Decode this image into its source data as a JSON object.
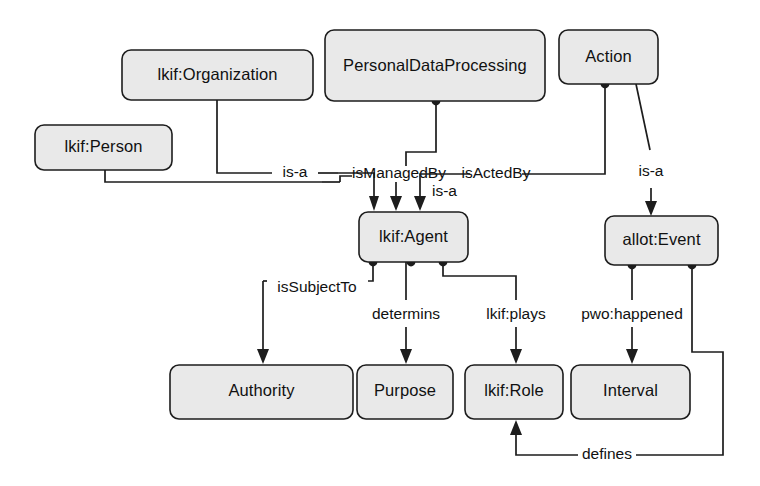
{
  "diagram": {
    "colors": {
      "node_fill": "#e9e9e9",
      "node_stroke": "#1d1d1d",
      "edge_stroke": "#1d1d1d",
      "background": "#ffffff",
      "text": "#111111"
    },
    "nodes": [
      {
        "id": "lkif-organization",
        "label": "lkif:Organization"
      },
      {
        "id": "lkif-person",
        "label": "lkif:Person"
      },
      {
        "id": "personaldataprocessing",
        "label": "PersonalDataProcessing"
      },
      {
        "id": "action",
        "label": "Action"
      },
      {
        "id": "lkif-agent",
        "label": "lkif:Agent"
      },
      {
        "id": "allot-event",
        "label": "allot:Event"
      },
      {
        "id": "authority",
        "label": "Authority"
      },
      {
        "id": "purpose",
        "label": "Purpose"
      },
      {
        "id": "lkif-role",
        "label": "lkif:Role"
      },
      {
        "id": "interval",
        "label": "Interval"
      }
    ],
    "edges": [
      {
        "id": "org-isa-agent",
        "label": "is-a",
        "from": "lkif:Organization",
        "to": "lkif:Agent"
      },
      {
        "id": "person-isa-agent",
        "label": "is-a",
        "from": "lkif:Person",
        "to": "lkif:Agent"
      },
      {
        "id": "pdp-ismanagedby",
        "label": "isManagedBy",
        "from": "PersonalDataProcessing",
        "to": "lkif:Agent"
      },
      {
        "id": "action-isactedby",
        "label": "isActedBy",
        "from": "Action",
        "to": "lkif:Agent"
      },
      {
        "id": "action-isa-event",
        "label": "is-a",
        "from": "Action",
        "to": "allot:Event"
      },
      {
        "id": "agent-issubjectto",
        "label": "isSubjectTo",
        "from": "lkif:Agent",
        "to": "Authority"
      },
      {
        "id": "agent-determins",
        "label": "determins",
        "from": "lkif:Agent",
        "to": "Purpose"
      },
      {
        "id": "agent-plays",
        "label": "lkif:plays",
        "from": "lkif:Agent",
        "to": "lkif:Role"
      },
      {
        "id": "event-pwohappened",
        "label": "pwo:happened",
        "from": "allot:Event",
        "to": "Interval"
      },
      {
        "id": "event-defines",
        "label": "defines",
        "from": "allot:Event",
        "to": "lkif:Role"
      }
    ]
  }
}
